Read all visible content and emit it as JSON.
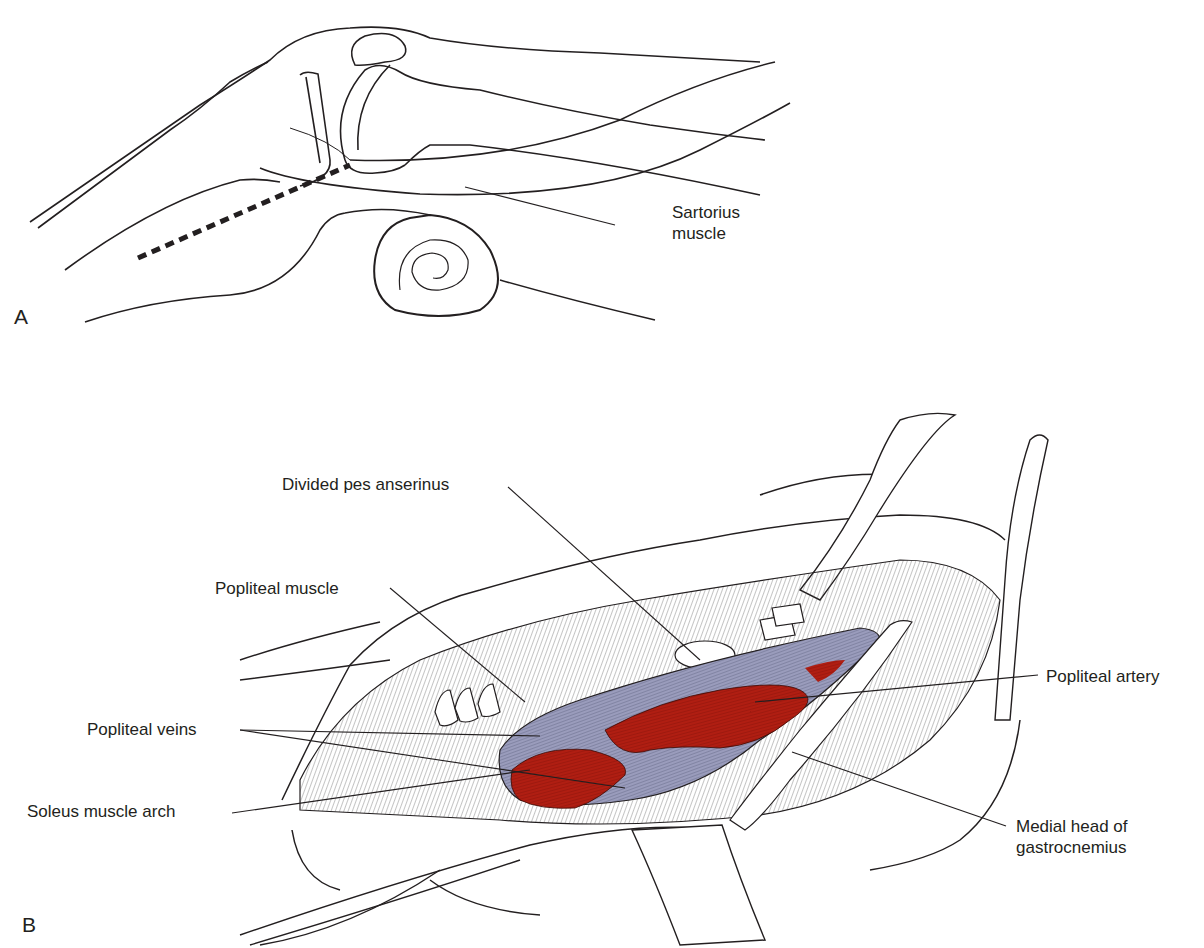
{
  "figure": {
    "panel_a": {
      "letter": "A",
      "labels": [
        {
          "id": "sartorius",
          "line1": "Sartorius",
          "line2": "muscle"
        }
      ]
    },
    "panel_b": {
      "letter": "B",
      "labels": {
        "divided_pes_anserinus": "Divided pes anserinus",
        "popliteal_muscle": "Popliteal muscle",
        "popliteal_veins": "Popliteal veins",
        "soleus_muscle_arch": "Soleus muscle arch",
        "popliteal_artery": "Popliteal artery",
        "medial_head_line1": "Medial head of",
        "medial_head_line2": "gastrocnemius"
      }
    },
    "colors": {
      "ink": "#231f20",
      "artery_red": "#b01e12",
      "vein_lavender": "#9a9cbc",
      "background": "#ffffff"
    }
  }
}
